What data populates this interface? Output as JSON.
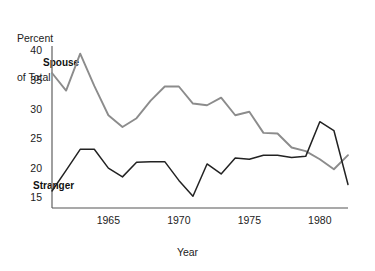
{
  "chart_data": {
    "type": "line",
    "title": "",
    "ylabel": "Percent\nof Total",
    "xlabel": "Year",
    "xlim": [
      1961,
      1982
    ],
    "ylim": [
      13.2,
      40.8
    ],
    "grid": false,
    "legend_position": "inline-annotation",
    "yticks": [
      15,
      20,
      25,
      30,
      35,
      40
    ],
    "xticks": [
      1965,
      1970,
      1975,
      1980
    ],
    "x": [
      1961,
      1962,
      1963,
      1964,
      1965,
      1966,
      1967,
      1968,
      1969,
      1970,
      1971,
      1972,
      1973,
      1974,
      1975,
      1976,
      1977,
      1978,
      1979,
      1980,
      1981,
      1982
    ],
    "series": [
      {
        "name": "Spouse",
        "color": "#8c8c8c",
        "values": [
          36.2,
          33.2,
          39.5,
          34.0,
          29.0,
          27.0,
          28.5,
          31.5,
          33.9,
          33.9,
          31.0,
          30.7,
          32.0,
          29.0,
          29.6,
          26.0,
          25.9,
          23.5,
          22.9,
          21.5,
          19.8,
          22.2
        ]
      },
      {
        "name": "Stranger",
        "color": "#222222",
        "values": [
          16.1,
          19.6,
          23.2,
          23.2,
          20.0,
          18.5,
          21.0,
          21.1,
          21.1,
          17.9,
          15.2,
          20.7,
          19.0,
          21.7,
          21.5,
          22.2,
          22.2,
          21.8,
          22.0,
          27.9,
          26.4,
          17.2
        ]
      }
    ]
  },
  "yticklabels": [
    "40",
    "35",
    "30",
    "25",
    "20",
    "15"
  ],
  "xticklabels": [
    "1965",
    "1970",
    "1975",
    "1980"
  ],
  "ylabel_line1": "Percent",
  "ylabel_line2": "of Total",
  "xlabel_text": "Year",
  "series_labels": {
    "spouse": "Spouse",
    "stranger": "Stranger"
  },
  "colors": {
    "spouse_line": "#8c8c8c",
    "stranger_line": "#222222",
    "axis": "#555555",
    "background": "#ffffff"
  }
}
